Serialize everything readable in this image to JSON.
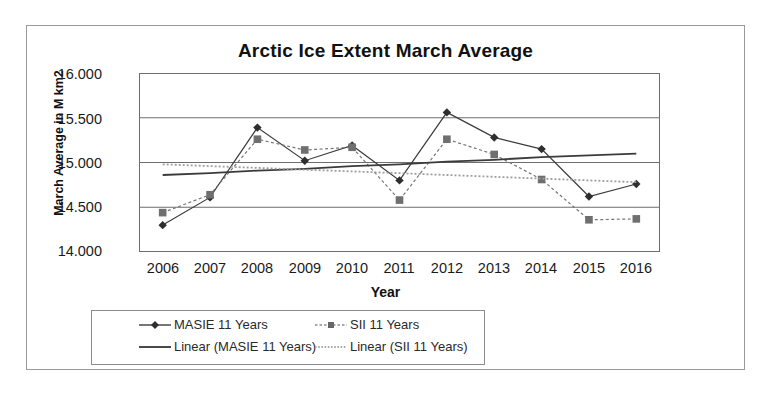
{
  "chart_data": {
    "type": "line",
    "title": "Arctic Ice Extent March Average",
    "xlabel": "Year",
    "ylabel": "March Average in M km2",
    "categories": [
      "2006",
      "2007",
      "2008",
      "2009",
      "2010",
      "2011",
      "2012",
      "2013",
      "2014",
      "2015",
      "2016"
    ],
    "ylim": [
      14.0,
      16.0
    ],
    "ytick_labels": [
      "16.000",
      "15.500",
      "15.000",
      "14.500",
      "14.000"
    ],
    "ytick_values": [
      16.0,
      15.5,
      15.0,
      14.5,
      14.0
    ],
    "grid": true,
    "legend_position": "bottom",
    "series": [
      {
        "name": "MASIE 11 Years",
        "marker": "diamond",
        "line_style": "solid",
        "color": "#3b3b3b",
        "values": [
          14.3,
          14.61,
          15.39,
          15.02,
          15.19,
          14.8,
          15.56,
          15.28,
          15.15,
          14.62,
          14.76
        ]
      },
      {
        "name": "SII 11 Years",
        "marker": "square",
        "line_style": "dotted",
        "color": "#767676",
        "values": [
          14.44,
          14.64,
          15.26,
          15.14,
          15.17,
          14.58,
          15.26,
          15.09,
          14.81,
          14.36,
          14.37
        ]
      },
      {
        "name": "Linear (MASIE 11 Years)",
        "marker": "none",
        "line_style": "solid",
        "color": "#3b3b3b",
        "trend": true,
        "values": [
          14.86,
          14.88,
          14.91,
          14.93,
          14.96,
          14.98,
          15.01,
          15.03,
          15.06,
          15.08,
          15.1
        ]
      },
      {
        "name": "Linear (SII 11 Years)",
        "marker": "none",
        "line_style": "dotted",
        "color": "#9e9e9e",
        "trend": true,
        "values": [
          14.98,
          14.96,
          14.94,
          14.92,
          14.9,
          14.88,
          14.86,
          14.84,
          14.82,
          14.8,
          14.78
        ]
      }
    ]
  },
  "legend": {
    "entries": [
      {
        "label": "MASIE 11 Years",
        "key": "line-marker-diamond"
      },
      {
        "label": "SII 11 Years",
        "key": "line-marker-square"
      },
      {
        "label": "Linear (MASIE 11 Years)",
        "key": "line-solid"
      },
      {
        "label": "Linear (SII 11 Years)",
        "key": "line-dotted"
      }
    ]
  },
  "colors": {
    "frame": "#9a9a9a",
    "grid": "#6e6e6e",
    "masie": "#3b3b3b",
    "sii": "#767676",
    "masie_trend": "#3b3b3b",
    "sii_trend": "#9e9e9e",
    "text": "#1a1a1a",
    "background": "#ffffff"
  }
}
